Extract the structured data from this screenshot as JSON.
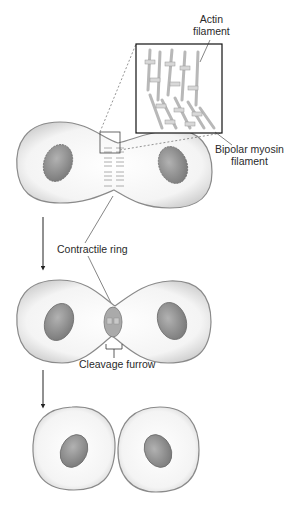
{
  "labels": {
    "actin": [
      "Actin",
      "filament"
    ],
    "myosin": [
      "Bipolar myosin",
      "filament"
    ],
    "contractile_ring": "Contractile ring",
    "cleavage_furrow": "Cleavage furrow"
  },
  "stages": [
    {
      "name": "early-cytokinesis",
      "description": "Cell with contractile ring forming at equator"
    },
    {
      "name": "furrow-ingression",
      "description": "Cleavage furrow deepening"
    },
    {
      "name": "daughter-cells",
      "description": "Two separated daughter cells"
    }
  ],
  "colors": {
    "cell_fill": "#f2f2f2",
    "cell_edge": "#8a8a8a",
    "nucleus": "#8e8e8e",
    "nucleus_edge": "#6e6e6e",
    "line": "#333333",
    "filament": "#c9c9c9"
  }
}
